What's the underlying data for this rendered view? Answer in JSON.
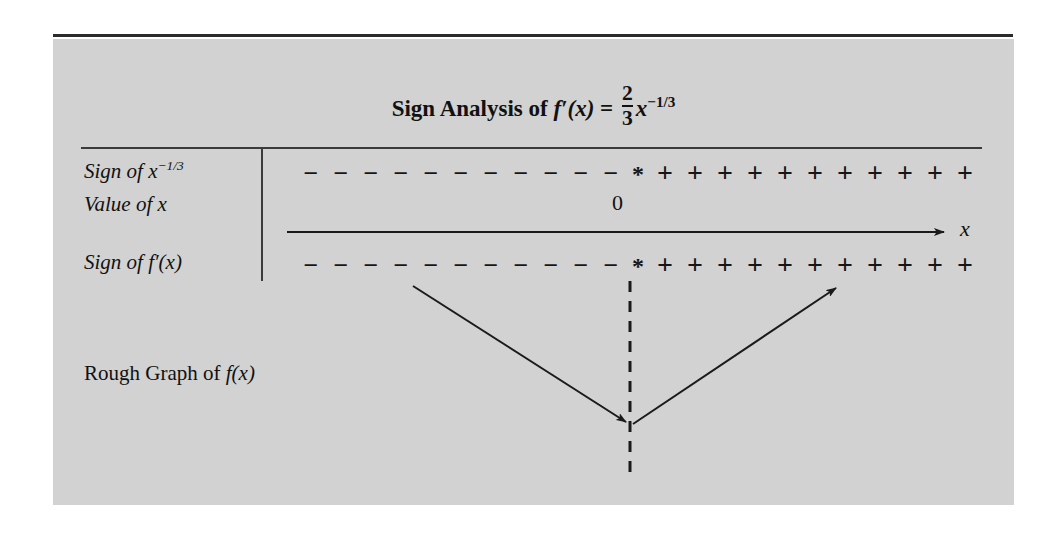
{
  "figure": {
    "title": {
      "prefix": "Sign Analysis of ",
      "function": "f′(x)",
      "equals": " = ",
      "frac_num": "2",
      "frac_den": "3",
      "var": "x",
      "exponent": "−1/3"
    },
    "rows": [
      {
        "name": "sign-of-x-power",
        "label_prefix": "Sign of ",
        "label_var": "x",
        "label_exponent": "−1/3",
        "signs": [
          "−",
          "−",
          "−",
          "−",
          "−",
          "−",
          "−",
          "−",
          "−",
          "−",
          "−",
          "*",
          "+",
          "+",
          "+",
          "+",
          "+",
          "+",
          "+",
          "+",
          "+",
          "+",
          "+"
        ]
      },
      {
        "name": "value-of-x",
        "label_prefix": "Value of ",
        "label_var": "x",
        "label_exponent": "",
        "value": "0"
      },
      {
        "name": "sign-of-f-prime",
        "label_prefix": "Sign of ",
        "label_var": "f′(x)",
        "label_exponent": "",
        "signs": [
          "−",
          "−",
          "−",
          "−",
          "−",
          "−",
          "−",
          "−",
          "−",
          "−",
          "−",
          "*",
          "+",
          "+",
          "+",
          "+",
          "+",
          "+",
          "+",
          "+",
          "+",
          "+",
          "+"
        ]
      }
    ],
    "axis": {
      "label": "x"
    },
    "rough_graph": {
      "caption_prefix": "Rough Graph of ",
      "caption_function": "f(x)"
    },
    "colors": {
      "panel_background": "#d2d2d2",
      "ink": "#111111",
      "rule": "#3b3b3b",
      "page_background": "#ffffff"
    }
  },
  "chart_data": {
    "type": "line",
    "xlabel": "x",
    "ylabel": "",
    "grid": false,
    "legend": "none",
    "critical_points": [
      {
        "x": 0,
        "marker": "*",
        "label": "0",
        "note": "f′ undefined (vertical tangent / cusp)"
      }
    ],
    "sign_intervals": [
      {
        "series": "Sign of x^(-1/3)",
        "interval": "x < 0",
        "sign": "−"
      },
      {
        "series": "Sign of x^(-1/3)",
        "interval": "x = 0",
        "sign": "*"
      },
      {
        "series": "Sign of x^(-1/3)",
        "interval": "x > 0",
        "sign": "+"
      },
      {
        "series": "Sign of f′(x)",
        "interval": "x < 0",
        "sign": "−"
      },
      {
        "series": "Sign of f′(x)",
        "interval": "x = 0",
        "sign": "*"
      },
      {
        "series": "Sign of f′(x)",
        "interval": "x > 0",
        "sign": "+"
      }
    ],
    "rough_graph_shape": {
      "description": "V-shaped cusp: decreasing arrow into the cusp at x = 0, then increasing arrow away from it",
      "segments": [
        {
          "name": "decreasing-branch",
          "from": [
            -1.0,
            1.0
          ],
          "to": [
            0.0,
            0.0
          ],
          "direction": "down-right",
          "arrow": "end"
        },
        {
          "name": "increasing-branch",
          "from": [
            0.0,
            0.0
          ],
          "to": [
            1.0,
            1.0
          ],
          "direction": "up-right",
          "arrow": "end"
        }
      ],
      "vertical_dashed_line_at_x": 0
    }
  }
}
